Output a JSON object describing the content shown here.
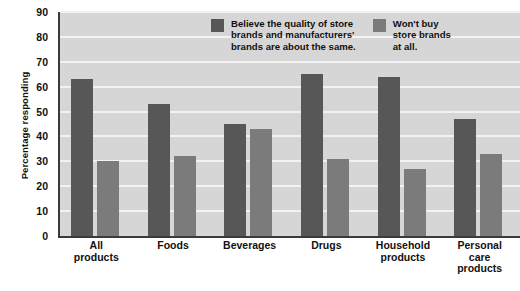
{
  "chart_data": {
    "type": "bar",
    "title": "",
    "subtitle": "",
    "xlabel": "",
    "ylabel": "Percentage responding",
    "ylim": [
      0,
      90
    ],
    "ytick_step": 10,
    "yticks": [
      "90",
      "80",
      "70",
      "60",
      "50",
      "40",
      "30",
      "20",
      "10",
      "0"
    ],
    "grid": true,
    "legend_position": "top-right-inside",
    "categories": [
      "All\nproducts",
      "Foods",
      "Beverages",
      "Drugs",
      "Household\nproducts",
      "Personal\ncare\nproducts"
    ],
    "series": [
      {
        "name": "Believe the quality of store brands and manufacturers' brands are about the same.",
        "color": "#575757",
        "values": [
          63,
          53,
          45,
          65,
          64,
          47
        ]
      },
      {
        "name": "Won't buy store brands at all.",
        "color": "#7b7b7b",
        "values": [
          30,
          32,
          43,
          31,
          27,
          33
        ]
      }
    ]
  },
  "legend": {
    "items": [
      {
        "label": "Believe the quality of store\nbrands and manufacturers'\nbrands are about the same.",
        "color": "#575757"
      },
      {
        "label": "Won't buy\nstore brands\nat all.",
        "color": "#7b7b7b"
      }
    ]
  },
  "colors": {
    "plot_background": "#d6d6d6",
    "gridline": "#f2f2f2",
    "axis": "#3a3a3a",
    "series_dark": "#575757",
    "series_light": "#7b7b7b",
    "text": "#111111",
    "page_background": "#ffffff"
  }
}
